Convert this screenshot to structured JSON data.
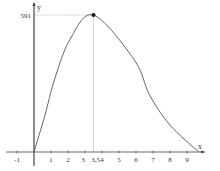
{
  "chart_data": {
    "type": "line",
    "title": "",
    "xlabel": "x",
    "ylabel": "y",
    "x_ticks": [
      "-1",
      "1",
      "2",
      "3",
      "3,5",
      "4",
      "5",
      "6",
      "7",
      "8",
      "9"
    ],
    "x_tick_values": [
      -1,
      1,
      2,
      3,
      3.5,
      4,
      5,
      6,
      7,
      8,
      9
    ],
    "y_ticks": [
      "591"
    ],
    "y_tick_values": [
      591
    ],
    "xlim": [
      -2,
      10.5
    ],
    "ylim": [
      0,
      640
    ],
    "grid": false,
    "legend": null,
    "annotations": [
      {
        "type": "point",
        "x": 3.5,
        "y": 591,
        "label": "maximum"
      },
      {
        "type": "dashed-guide",
        "from": [
          0,
          591
        ],
        "to": [
          3.5,
          591
        ]
      },
      {
        "type": "guide",
        "from": [
          3.5,
          0
        ],
        "to": [
          3.5,
          591
        ]
      }
    ],
    "series": [
      {
        "name": "f(x)",
        "x": [
          0,
          0.65,
          1.2,
          2.1,
          3.5,
          5.9,
          6.8,
          8,
          9.7
        ],
        "y": [
          0,
          160,
          311,
          483,
          591,
          397,
          246,
          116,
          0
        ]
      }
    ]
  }
}
